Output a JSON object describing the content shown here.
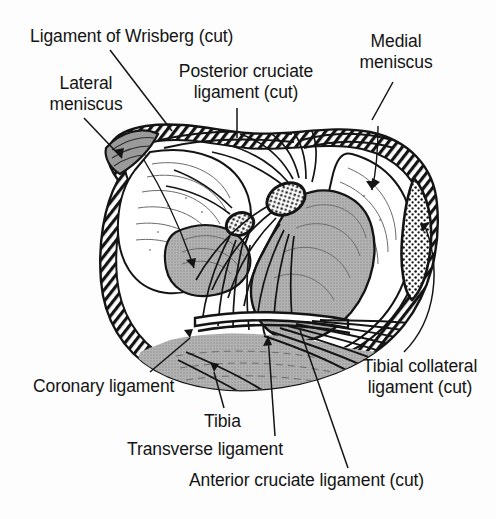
{
  "figure": {
    "background_color": "#fdfdfd",
    "ink_color": "#141414",
    "shade_gray": "#a9a9a9",
    "shade_light": "#ffffff",
    "width": 496,
    "height": 519
  },
  "labels": {
    "wrisberg": "Ligament of Wrisberg (cut)",
    "lateral_meniscus": "Lateral meniscus",
    "posterior_cruciate": "Posterior cruciate ligament (cut)",
    "medial_meniscus": "Medial meniscus",
    "coronary_ligament": "Coronary ligament",
    "tibial_collateral": "Tibial collateral ligament (cut)",
    "tibia": "Tibia",
    "transverse_ligament": "Transverse ligament",
    "anterior_cruciate": "Anterior cruciate ligament (cut)"
  }
}
